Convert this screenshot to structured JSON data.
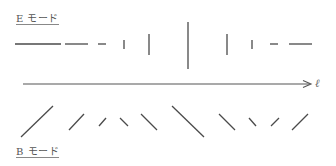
{
  "diagram": {
    "e_mode_label": "E モード",
    "b_mode_label": "B モード",
    "axis_label": "ℓ",
    "colors": {
      "stroke": "#4a4a4a",
      "background": "#ffffff",
      "label": "#555555"
    },
    "e_mode_pattern": [
      "horizontal-long",
      "horizontal-medium",
      "horizontal-short",
      "vertical-short",
      "vertical-medium",
      "vertical-long",
      "vertical-medium",
      "vertical-short",
      "horizontal-short",
      "horizontal-medium"
    ],
    "b_mode_pattern": [
      "diagonal-ne-long",
      "diagonal-ne-medium",
      "diagonal-ne-short",
      "diagonal-nw-short",
      "diagonal-nw-medium",
      "diagonal-nw-long",
      "diagonal-nw-medium",
      "diagonal-nw-short",
      "diagonal-ne-short",
      "diagonal-ne-medium"
    ]
  }
}
